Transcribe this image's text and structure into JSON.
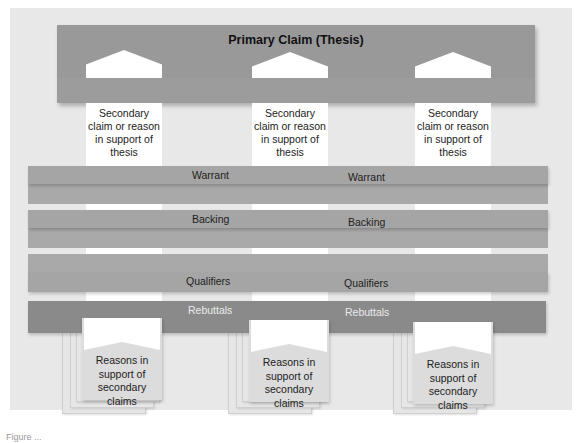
{
  "diagram": {
    "title": "Primary Claim (Thesis)",
    "colors": {
      "panel_bg": "#e8e8e8",
      "primary_bar": "#999999",
      "band": "#a5a5a5",
      "rebuttals_band": "#8a8a8a",
      "column": "#ffffff",
      "reason_box": "#dcdcdc"
    },
    "columns": [
      {
        "secondary_text": [
          "Secondary",
          "claim or reason",
          "in support of",
          "thesis"
        ],
        "reasons_text": [
          "Reasons in",
          "support of",
          "secondary claims"
        ]
      },
      {
        "secondary_text": [
          "Secondary",
          "claim or reason",
          "in support of",
          "thesis"
        ],
        "reasons_text": [
          "Reasons in",
          "support of",
          "secondary claims"
        ]
      },
      {
        "secondary_text": [
          "Secondary",
          "claim or reason",
          "in support of",
          "thesis"
        ],
        "reasons_text": [
          "Reasons in",
          "support of",
          "secondary claims"
        ]
      }
    ],
    "bands": {
      "warrant": {
        "label_left": "Warrant",
        "label_right": "Warrant"
      },
      "backing": {
        "label_left": "Backing",
        "label_right": "Backing"
      },
      "qualifiers": {
        "label_left": "Qualifiers",
        "label_right": "Qualifiers"
      },
      "rebuttals": {
        "label_left": "Rebuttals",
        "label_right": "Rebuttals"
      }
    },
    "caption": "Figure ..."
  }
}
